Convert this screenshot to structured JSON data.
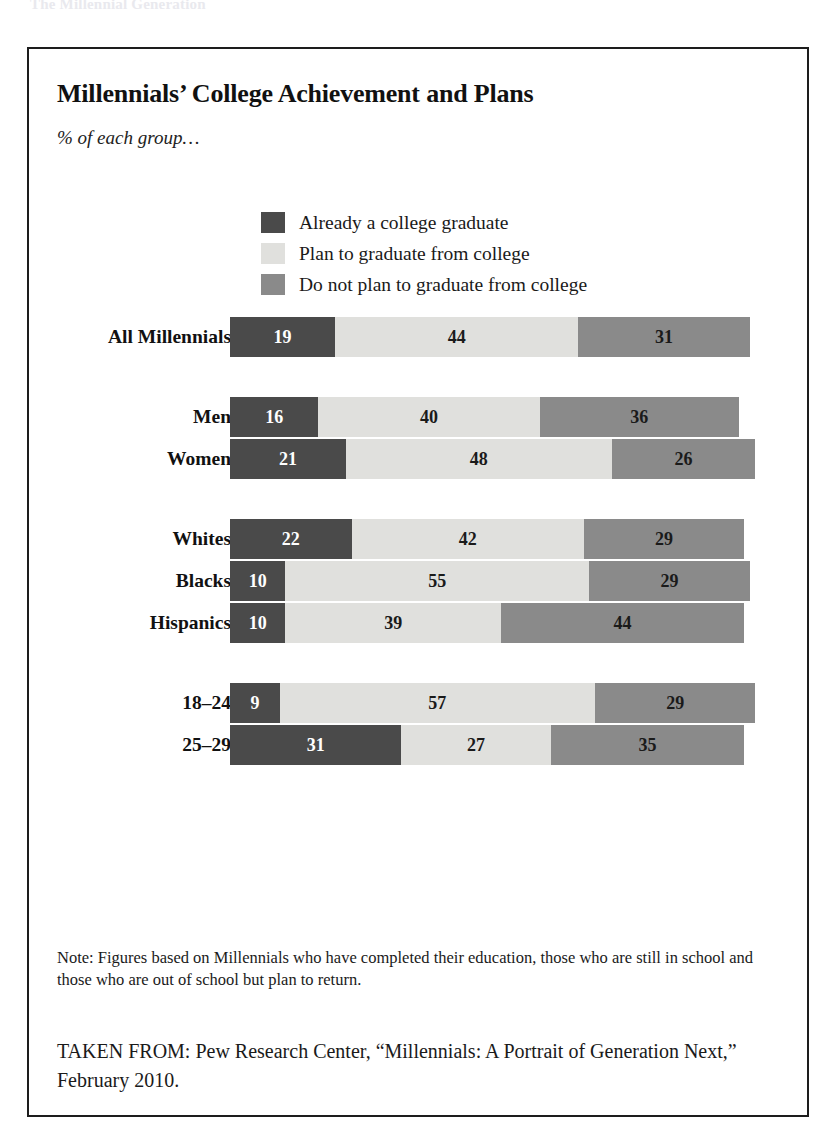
{
  "running_head": "The Millennial Generation",
  "figure": {
    "title": "Millennials’ College Achievement and Plans",
    "subtitle": "% of each group…",
    "note": "Note: Figures based on Millennials who have completed their education, those who are still in school and those who are out of school but plan to return.",
    "source": "TAKEN FROM: Pew Research Center, “Millennials: A Portrait of Generation Next,” February 2010."
  },
  "colors": {
    "graduate": "#4a4a4a",
    "plan": "#e0e0dd",
    "no_plan": "#8a8a8a",
    "border": "#1d1d1d",
    "background": "#ffffff"
  },
  "chart_data": {
    "type": "bar",
    "orientation": "horizontal",
    "stacked": true,
    "title": "Millennials’ College Achievement and Plans",
    "subtitle": "% of each group…",
    "xlabel": "",
    "ylabel": "",
    "xlim": [
      0,
      94
    ],
    "grid": false,
    "legend_position": "top-center",
    "categories": [
      "All Millennials",
      "Men",
      "Women",
      "Whites",
      "Blacks",
      "Hispanics",
      "18–24",
      "25–29"
    ],
    "series": [
      {
        "name": "Already a college graduate",
        "color": "#4a4a4a",
        "values": [
          19,
          16,
          21,
          22,
          10,
          10,
          9,
          31
        ]
      },
      {
        "name": "Plan to graduate from college",
        "color": "#e0e0dd",
        "values": [
          44,
          40,
          48,
          42,
          55,
          39,
          57,
          27
        ]
      },
      {
        "name": "Do not plan to graduate from college",
        "color": "#8a8a8a",
        "values": [
          31,
          36,
          26,
          29,
          29,
          44,
          29,
          35
        ]
      }
    ],
    "annotations": [
      "Note: Figures based on Millennials who have completed their education, those who are still in school and those who are out of school but plan to return.",
      "TAKEN FROM: Pew Research Center, “Millennials: A Portrait of Generation Next,” February 2010."
    ]
  },
  "legend": [
    {
      "label": "Already a college graduate",
      "color": "#4a4a4a",
      "swatch": "legend-swatch-graduate"
    },
    {
      "label": "Plan to graduate from college",
      "color": "#e0e0dd",
      "swatch": "legend-swatch-plan"
    },
    {
      "label": "Do not plan to graduate from college",
      "color": "#8a8a8a",
      "swatch": "legend-swatch-noplan"
    }
  ],
  "rows": [
    {
      "label": "All Millennials",
      "graduate": 19,
      "plan": 44,
      "no_plan": 31,
      "group_start": false
    },
    {
      "label": "Men",
      "graduate": 16,
      "plan": 40,
      "no_plan": 36,
      "group_start": true
    },
    {
      "label": "Women",
      "graduate": 21,
      "plan": 48,
      "no_plan": 26,
      "group_start": false
    },
    {
      "label": "Whites",
      "graduate": 22,
      "plan": 42,
      "no_plan": 29,
      "group_start": true
    },
    {
      "label": "Blacks",
      "graduate": 10,
      "plan": 55,
      "no_plan": 29,
      "group_start": false
    },
    {
      "label": "Hispanics",
      "graduate": 10,
      "plan": 39,
      "no_plan": 44,
      "group_start": false
    },
    {
      "label": "18–24",
      "graduate": 9,
      "plan": 57,
      "no_plan": 29,
      "group_start": true
    },
    {
      "label": "25–29",
      "graduate": 31,
      "plan": 27,
      "no_plan": 35,
      "group_start": false
    }
  ]
}
